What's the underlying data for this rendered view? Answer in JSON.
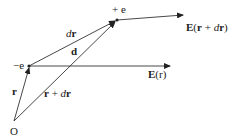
{
  "diagram": {
    "type": "vector-diagram",
    "points": {
      "origin": {
        "label": "O",
        "x": 14,
        "y": 121
      },
      "neg_charge": {
        "label": "−e",
        "x": 29,
        "y": 66
      },
      "pos_charge": {
        "label": "+ e",
        "x": 117,
        "y": 20
      }
    },
    "vectors": [
      {
        "name": "r",
        "label": "r",
        "from": "origin",
        "to": "neg_charge"
      },
      {
        "name": "r-plus-dr",
        "label": "r + dr",
        "from": "origin",
        "to": "pos_charge"
      },
      {
        "name": "dr",
        "label": "dr",
        "from": "neg_charge",
        "to": "pos_charge"
      },
      {
        "name": "d",
        "label": "d",
        "from": "neg_charge",
        "to": "pos_charge"
      },
      {
        "name": "E-r",
        "label": "E(r)",
        "from": "neg_charge",
        "to_xy": [
          170,
          66
        ]
      },
      {
        "name": "E-r-plus-dr",
        "label": "E(r + dr)",
        "from": "pos_charge",
        "to_xy": [
          183,
          15
        ]
      }
    ],
    "labels": {
      "origin": "O",
      "neg_charge": "−e",
      "pos_charge": "+ e",
      "r": "r",
      "r_plus_dr_bold": "r",
      "r_plus_dr_rest": " + ",
      "r_plus_dr_d": "d",
      "r_plus_dr_r": "r",
      "dr_d": "d",
      "dr_r": "r",
      "d": "d",
      "E_r_E": "E",
      "E_r_arg": "(r)",
      "E_rdr_E": "E",
      "E_rdr_open": "(",
      "E_rdr_r": "r",
      "E_rdr_plus": " + ",
      "E_rdr_d": "d",
      "E_rdr_r2": "r",
      "E_rdr_close": ")"
    },
    "colors": {
      "stroke": "#333333",
      "text": "#222222",
      "background": "#ffffff"
    }
  }
}
